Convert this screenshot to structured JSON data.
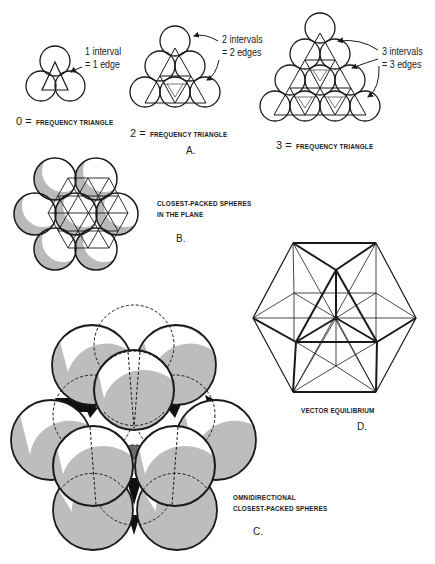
{
  "figure": {
    "panel_a": {
      "letter": "A.",
      "triangles": [
        {
          "frequency": "0",
          "caption_eq": "0 =",
          "caption": "FREQUENCY TRIANGLE",
          "note_line1": "1 interval",
          "note_line2": "= 1 edge"
        },
        {
          "frequency": "2",
          "caption_eq": "2 =",
          "caption": "FREQUENCY TRIANGLE",
          "note_line1": "2 intervals",
          "note_line2": "= 2 edges"
        },
        {
          "frequency": "3",
          "caption_eq": "3 =",
          "caption": "FREQUENCY TRIANGLE",
          "note_line1": "3 intervals",
          "note_line2": "= 3 edges"
        }
      ]
    },
    "panel_b": {
      "letter": "B.",
      "caption_line1": "CLOSEST-PACKED SPHERES",
      "caption_line2": "IN THE PLANE"
    },
    "panel_c": {
      "letter": "C.",
      "caption_line1": "OMNIDIRECTIONAL",
      "caption_line2": "CLOSEST-PACKED SPHERES"
    },
    "panel_d": {
      "letter": "D.",
      "caption": "VECTOR EQUILIBRIUM"
    }
  },
  "colors": {
    "ink": "#1a1a1a",
    "shade": "#b9b9b9",
    "dark_fill": "#111111",
    "mid_fill": "#6a6a6a",
    "paper": "#ffffff"
  }
}
